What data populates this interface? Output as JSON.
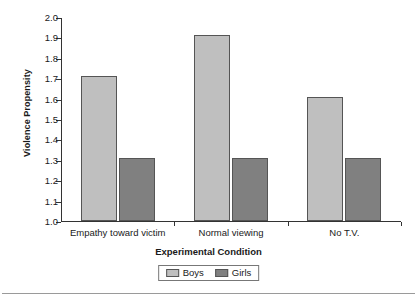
{
  "chart_data": {
    "type": "bar",
    "title": "",
    "subtitle": "",
    "xlabel": "Experimental Condition",
    "ylabel": "Violence Propensity",
    "categories": [
      "Empathy toward victim",
      "Normal viewing",
      "No T.V."
    ],
    "series": [
      {
        "name": "Boys",
        "color": "#bfbfbf",
        "values": [
          1.71,
          1.91,
          1.61
        ]
      },
      {
        "name": "Girls",
        "color": "#808080",
        "values": [
          1.31,
          1.31,
          1.31
        ]
      }
    ],
    "ylim": [
      1.0,
      2.0
    ],
    "ytick_labels": [
      "2.0",
      "1.9",
      "1.8",
      "1.7",
      "1.6",
      "1.5",
      "1.4",
      "1.3",
      "1.2",
      "1.1",
      "1.0"
    ],
    "ytick_values": [
      2.0,
      1.9,
      1.8,
      1.7,
      1.6,
      1.5,
      1.4,
      1.3,
      1.2,
      1.1,
      1.0
    ],
    "grid": false,
    "legend_position": "bottom",
    "legend_entries": [
      "Boys",
      "Girls"
    ],
    "axis_frame": "left-bottom-only"
  }
}
